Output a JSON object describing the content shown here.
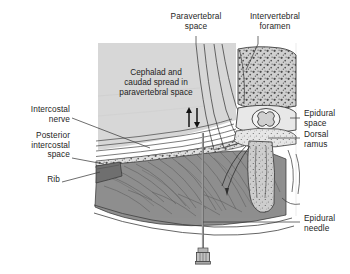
{
  "figure": {
    "background_color": "#ffffff",
    "text_color": "#262626"
  },
  "labels": {
    "paravertebral_space": "Paravertebral\nspace",
    "intervertebral_foramen": "Intervertebral\nforamen",
    "intercostal_nerve": "Intercostal\nnerve",
    "posterior_intercostal_space": "Posterior\nintercostal\nspace",
    "rib": "Rib",
    "epidural_space": "Epidural\nspace",
    "dorsal_ramus": "Dorsal\nramus",
    "epidural_needle": "Epidural\nneedle"
  },
  "annotation": {
    "spread_text": "Cephalad and\ncaudad spread in\nparavertebral space"
  },
  "colors": {
    "lung_field": "#d7d7d7",
    "muscle": "#8f8f8f",
    "muscle_dark": "#6f6f6f",
    "bone": "#cfcfcf",
    "outline": "#3a3a3a",
    "leader_line": "#444444",
    "needle": "#9a9a9a"
  }
}
